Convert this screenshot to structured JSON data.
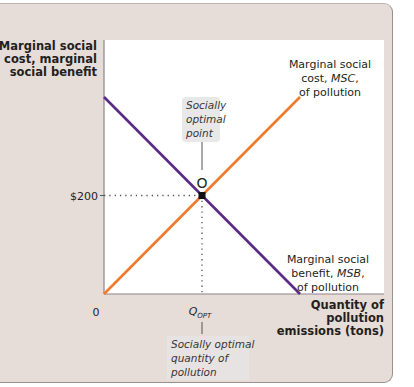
{
  "chart_data": {
    "type": "line",
    "title": "",
    "ylabel": [
      "Marginal social",
      "cost, marginal",
      "social benefit"
    ],
    "xlabel": [
      "Quantity of",
      "pollution",
      "emissions (tons)"
    ],
    "xlim": [
      0,
      2
    ],
    "ylim": [
      0,
      530
    ],
    "grid": false,
    "y_ticks": [
      {
        "value": 200,
        "label": "$200"
      }
    ],
    "x_ticks": [
      {
        "value": 0,
        "label": "0"
      },
      {
        "value": 1,
        "label": "Q",
        "subscript": "OPT"
      }
    ],
    "series": [
      {
        "name": "Marginal social benefit, MSB, of pollution",
        "color": "#5b2a86",
        "points": [
          [
            0,
            400
          ],
          [
            2,
            0
          ]
        ],
        "label_lines": [
          {
            "text": "Marginal social"
          },
          {
            "text": "benefit, ",
            "italic": "MSB",
            "after": ","
          },
          {
            "text": "of pollution"
          }
        ]
      },
      {
        "name": "Marginal social cost, MSC, of pollution",
        "color": "#f07b2c",
        "points": [
          [
            0,
            0
          ],
          [
            2,
            400
          ]
        ],
        "label_lines": [
          {
            "text": "Marginal social"
          },
          {
            "text": "cost, ",
            "italic": "MSC",
            "after": ","
          },
          {
            "text": "of pollution"
          }
        ]
      }
    ],
    "annotations": [
      {
        "id": "optimal-point",
        "label": "O",
        "x": 1,
        "y": 200,
        "callout": [
          "Socially",
          "optimal",
          "point"
        ]
      },
      {
        "id": "optimal-quantity",
        "callout": [
          "Socially optimal",
          "quantity of",
          "pollution"
        ]
      }
    ],
    "origin_label": "0"
  },
  "colors": {
    "frame": "#e6dcd8",
    "plot_bg": "#ffffff",
    "msb": "#5b2a86",
    "msc": "#f07b2c",
    "callout_bg": "#e8e8e8"
  }
}
